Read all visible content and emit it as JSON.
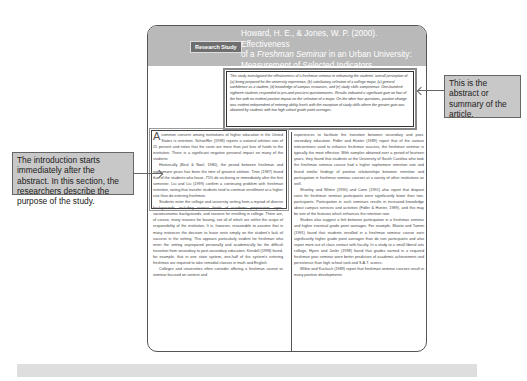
{
  "article": {
    "badge": "Research Study",
    "title_line1": "Howard, H. E., & Jones, W. P. (2000). Effectiveness",
    "title_line2_pre": "of a ",
    "title_line2_italic": "Freshman Seminar",
    "title_line2_post": " in an Urban University:",
    "title_line3": "Measurement of Selected Indicators",
    "abstract": "This study investigated the effectiveness of a freshman seminar in enhancing the students' overall perception of: (a) being prepared for the university experience, (b) satisfactory selection of a college major, (c) general confidence as a student, (d) knowledge of campus resources, and (e) study skills competence. One-hundred eighteen students responded to pre-and post-test questionnaires. Results indicated a significant gain on four of the five with no evident positive impact on the selection of a major. On the other four questions, positive change was evident independent of entering ability levels with the exception of study skills where the greater gain was obtained by students with low high school grade point averages.",
    "col1": [
      "common concern among institutions of higher education in the United States is retention. Schoeffler (1998) reports a national attrition rate of 25 percent and notes that the costs are more than just loss of funds to the institution. There is a significant negative personal impact on many of the students.",
      "Historically (Beal & Noel, 1980), the period between freshman and sophomore years has been the time of greatest attrition. Tinto (1987) found that of the students who leave, 75% do so during or immediately after the first semester. Liu and Liu (1999) confirm a continuing problem with freshman retention, noting that transfer students tend to continue enrollment at a higher rate than do entering freshmen.",
      "Students enter the college and university setting from a myriad of diverse backgrounds, including various levels of academic preparation, ages, socioeconomic backgrounds, and reasons for enrolling in college. There are, of course, many reasons for leaving, not all of which are within the scope of responsibility of the institution. It is, however, reasonable to assume that in many instances the decision to leave rests simply on the student's lack of success in the setting. This appears particularly evident for freshman who enter the setting unprepared personally and academically for the difficult transition from secondary to post-secondary education. Kendell (1998) found, for example, that in one state system, one-half of the system's entering freshman are required to take remedial classes in math and English.",
      "Colleges and universities often consider offering a freshman course or seminar focused on content and"
    ],
    "col1_dropcap": "A",
    "col2": [
      "experiences to facilitate the transition between secondary and post-secondary education. Fidler and Hunter (1989) report that of the various interventions used to enhance freshman success, the freshman seminar is typically the most effective. With samples obtained over a period of fourteen years, they found that students at the University of South Carolina who took the freshman seminar course had a higher sophomore retention rate and found similar findings of positive relationships between retention and participation in freshman seminar courses at a variety of other institutions as well.",
      "Shanley and Witten (1990) and Cone (1991) also report that dropout rates for freshman seminar participants were significantly lower than non-participants. Participation in such seminars results in increased knowledge about campus services and activities (Fidler & Hunter, 1989), and this may be one of the features which enhances the retention rate.",
      "Studies also suggest a link between participation in a freshman seminar and higher eventual grade point averages. For example, Maisto and Tammi (1991) found that students enrolled in a freshman seminar course earn significantly higher grade point averages than do non participants and also report more out of class contact with faculty. In a study at a small liberal arts college, Hyers and Joslin (1998) found that grades earned in a required freshman year seminar were better predictors of academic achievement and persistence than high school rank and S.A.T. scores.",
      "Wilkie and Kuckuck (1989) report that freshman seminar courses result in many positive developments"
    ]
  },
  "callouts": {
    "abstract_note": "This is the abstract or summary of the article.",
    "intro_note": "The introduction starts immediately after the abstract. In this section, the researchers describe the purpose of the study."
  }
}
